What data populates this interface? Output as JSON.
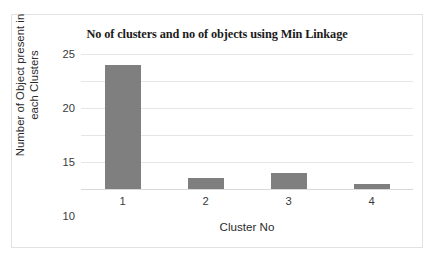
{
  "chart_data": {
    "type": "bar",
    "title": "No of clusters and no of objects using Min Linkage",
    "xlabel": "Cluster No",
    "ylabel_line1": "Number of Object present in",
    "ylabel_line2": "each Clusters",
    "categories": [
      "1",
      "2",
      "3",
      "4"
    ],
    "values": [
      23,
      2,
      3,
      1
    ],
    "series": [
      {
        "name": "Number of Object present in each Clusters",
        "values": [
          23,
          2,
          3,
          1
        ]
      }
    ],
    "ylim": [
      0,
      25
    ],
    "yticks": [
      0,
      5,
      10,
      15,
      20,
      25
    ],
    "ytick_labels": [
      "0",
      "5",
      "10",
      "15",
      "20",
      "25"
    ],
    "grid": true,
    "grid_axis": "y",
    "legend": false,
    "bar_color": "#7f7f7f",
    "grid_color": "#e6e6e6",
    "axis_text_color": "#3a3a3a",
    "title_color": "#1b1b1b",
    "frame_border_color": "#e2e2e2",
    "background_color": "#ffffff"
  }
}
